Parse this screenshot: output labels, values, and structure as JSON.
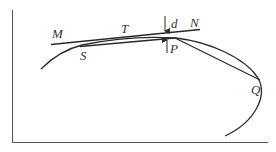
{
  "diagram": {
    "colors": {
      "stroke": "#2a2a2a",
      "axis": "#555555",
      "label": "#333333",
      "background": "#ffffff"
    },
    "labels": {
      "M": "M",
      "T": "T",
      "d": "d",
      "N": "N",
      "S": "S",
      "P": "P",
      "Q": "Q"
    },
    "elements": [
      {
        "id": "axes",
        "type": "frame",
        "desc": "left and bottom axis lines"
      },
      {
        "id": "curve",
        "type": "curve",
        "desc": "arc passing through S, P and Q"
      },
      {
        "id": "tangent-MN",
        "type": "line",
        "from": "M",
        "to": "N"
      },
      {
        "id": "chord-SP",
        "type": "line",
        "from": "S",
        "to": "P"
      },
      {
        "id": "chord-PQ",
        "type": "line",
        "from": "P",
        "to": "Q"
      },
      {
        "id": "arrow-d",
        "type": "arrow",
        "direction": "down",
        "label": "d"
      },
      {
        "id": "arrow-P",
        "type": "arrow",
        "direction": "up",
        "label": "P"
      }
    ]
  }
}
